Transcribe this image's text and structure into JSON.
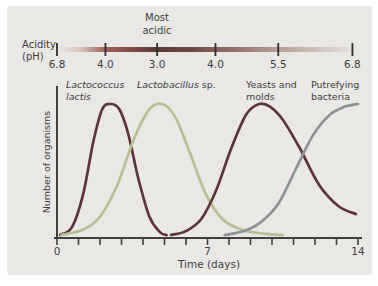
{
  "figure": {
    "background_color": "#e9e8e5",
    "text_color": "#3d3d3d",
    "axis_color": "#3f3f3f"
  },
  "ph_scale": {
    "axis_label_line1": "Acidity",
    "axis_label_line2": "(pH)",
    "annotation_line1": "Most",
    "annotation_line2": "acidic",
    "ticks": [
      {
        "value": "6.8",
        "pos": 0.0
      },
      {
        "value": "4.0",
        "pos": 0.162
      },
      {
        "value": "3.0",
        "pos": 0.335
      },
      {
        "value": "4.0",
        "pos": 0.53
      },
      {
        "value": "5.5",
        "pos": 0.74
      },
      {
        "value": "6.8",
        "pos": 0.988
      }
    ],
    "gradient_stops": [
      {
        "offset": 0.0,
        "color": "#ece7e3"
      },
      {
        "offset": 0.08,
        "color": "#d8c2bc"
      },
      {
        "offset": 0.162,
        "color": "#9d6258"
      },
      {
        "offset": 0.335,
        "color": "#5e3632"
      },
      {
        "offset": 0.44,
        "color": "#6f4540"
      },
      {
        "offset": 0.53,
        "color": "#8a5c55"
      },
      {
        "offset": 0.74,
        "color": "#b89e97"
      },
      {
        "offset": 1.0,
        "color": "#e8e4e0"
      }
    ]
  },
  "chart_data": {
    "type": "line",
    "title": "",
    "xlabel": "Time (days)",
    "ylabel": "Number of organisms",
    "xlim": [
      0,
      14
    ],
    "ylim": [
      0,
      1
    ],
    "y_axis_qualitative": true,
    "grid": false,
    "x_minor_tick_interval": 1,
    "x_major_ticks": [
      {
        "label": "0",
        "day": 0
      },
      {
        "label": "7",
        "day": 7
      },
      {
        "label": "14",
        "day": 14
      }
    ],
    "series": [
      {
        "name": "Lactococcus lactis",
        "slug": "lactococcus-lactis",
        "color": "#5f3338",
        "label_lines": [
          {
            "text": "Lactococcus",
            "italic": true
          },
          {
            "text": "lactis",
            "italic": true
          }
        ],
        "points": [
          [
            0.15,
            0.0
          ],
          [
            0.7,
            0.06
          ],
          [
            1.2,
            0.3
          ],
          [
            1.7,
            0.72
          ],
          [
            2.1,
            0.96
          ],
          [
            2.5,
            1.0
          ],
          [
            2.9,
            0.96
          ],
          [
            3.3,
            0.78
          ],
          [
            3.8,
            0.42
          ],
          [
            4.3,
            0.14
          ],
          [
            4.8,
            0.02
          ],
          [
            5.1,
            0.0
          ]
        ]
      },
      {
        "name": "Lactobacillus sp.",
        "slug": "lactobacillus-sp",
        "color": "#b7bf92",
        "label_lines": [
          {
            "text": "Lactobacillus",
            "italic": true
          },
          {
            "text": " sp.",
            "italic": false
          }
        ],
        "points": [
          [
            0.2,
            0.0
          ],
          [
            1.2,
            0.04
          ],
          [
            2.0,
            0.14
          ],
          [
            2.8,
            0.38
          ],
          [
            3.6,
            0.74
          ],
          [
            4.3,
            0.96
          ],
          [
            4.9,
            1.0
          ],
          [
            5.5,
            0.9
          ],
          [
            6.2,
            0.62
          ],
          [
            6.9,
            0.32
          ],
          [
            7.7,
            0.12
          ],
          [
            8.6,
            0.04
          ],
          [
            9.6,
            0.01
          ],
          [
            10.5,
            0.0
          ]
        ]
      },
      {
        "name": "Yeasts and molds",
        "slug": "yeasts-and-molds",
        "color": "#5f3338",
        "label_lines": [
          {
            "text": "Yeasts and",
            "italic": false
          },
          {
            "text": "molds",
            "italic": false
          }
        ],
        "points": [
          [
            5.3,
            0.0
          ],
          [
            6.0,
            0.03
          ],
          [
            6.7,
            0.12
          ],
          [
            7.4,
            0.34
          ],
          [
            8.1,
            0.66
          ],
          [
            8.8,
            0.92
          ],
          [
            9.4,
            1.0
          ],
          [
            9.9,
            0.98
          ],
          [
            10.5,
            0.88
          ],
          [
            11.3,
            0.66
          ],
          [
            12.2,
            0.38
          ],
          [
            13.1,
            0.22
          ],
          [
            13.9,
            0.16
          ]
        ]
      },
      {
        "name": "Putrefying bacteria",
        "slug": "putrefying-bacteria",
        "color": "#8b9492",
        "label_lines": [
          {
            "text": "Putrefying",
            "italic": false
          },
          {
            "text": "bacteria",
            "italic": false
          }
        ],
        "points": [
          [
            7.8,
            0.0
          ],
          [
            8.7,
            0.03
          ],
          [
            9.5,
            0.1
          ],
          [
            10.3,
            0.24
          ],
          [
            11.1,
            0.5
          ],
          [
            11.9,
            0.76
          ],
          [
            12.7,
            0.92
          ],
          [
            13.4,
            0.98
          ],
          [
            14.0,
            1.0
          ]
        ]
      }
    ]
  }
}
